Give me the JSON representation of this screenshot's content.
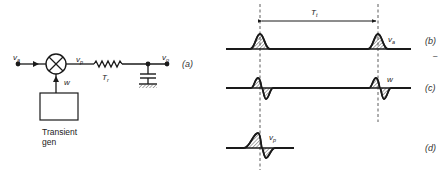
{
  "circuit": {
    "panel_label": "(a)",
    "input_label": "v",
    "input_sub": "a",
    "mixer_output_label": "v",
    "mixer_output_sub": "p",
    "modulation_label": "w",
    "resistor_label": "T",
    "resistor_sub": "r",
    "output_label": "v",
    "output_sub": "o",
    "generator_label_line1": "Transient",
    "generator_label_line2": "gen"
  },
  "waveforms": {
    "period_label": "T",
    "period_sub": "t",
    "b": {
      "panel_label": "(b)",
      "signal_label": "v",
      "signal_sub": "a"
    },
    "c": {
      "panel_label": "(c)",
      "signal_label": "w"
    },
    "d": {
      "panel_label": "(d)",
      "signal_label": "v",
      "signal_sub": "p"
    }
  },
  "colors": {
    "ink": "#1a1a1a",
    "background": "#ffffff"
  }
}
